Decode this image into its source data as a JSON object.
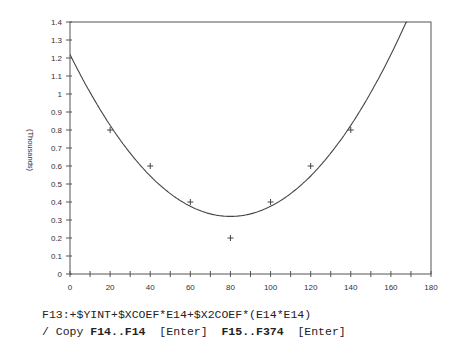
{
  "chart_data": {
    "type": "scatter",
    "title": "",
    "xlabel": "",
    "ylabel": "(Thousands)",
    "xlim": [
      0,
      180
    ],
    "ylim": [
      0,
      1.4
    ],
    "x_ticks": [
      0,
      20,
      40,
      60,
      80,
      100,
      120,
      140,
      160,
      180
    ],
    "y_ticks": [
      0,
      0.1,
      0.2,
      0.3,
      0.4,
      0.5,
      0.6,
      0.7,
      0.8,
      0.9,
      1,
      1.1,
      1.2,
      1.3,
      1.4
    ],
    "grid": false,
    "legend": null,
    "series": [
      {
        "name": "data",
        "marker": "+",
        "x": [
          20,
          40,
          60,
          80,
          100,
          120,
          140
        ],
        "y": [
          0.8,
          0.6,
          0.4,
          0.2,
          0.4,
          0.6,
          0.8
        ]
      },
      {
        "name": "quadratic fit",
        "type": "line",
        "intercept": 1.22,
        "x_coef": -0.0225,
        "x2_coef": 0.0001406
      }
    ]
  },
  "command_line": {
    "formula": "F13:+$YINT+$XCOEF*E14+$X2COEF*(E14*E14)",
    "copy_prefix": "/ Copy ",
    "copy_from": "F14..F14",
    "enter1": "[Enter]",
    "copy_to": "F15..F374",
    "enter2": "[Enter]"
  }
}
